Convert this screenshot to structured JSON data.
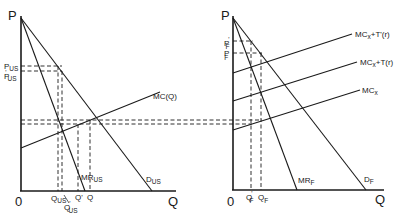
{
  "left_panel": {
    "name": "US market",
    "y_axis_label": "P",
    "x_axis_label": "Q",
    "origin_label": "0",
    "curves": {
      "demand": {
        "label": "D",
        "sub": "US"
      },
      "marginal_revenue": {
        "label": "MR",
        "sub": "US"
      },
      "marginal_cost": {
        "label": "MC(Q)"
      }
    },
    "price_labels": [
      {
        "label": "P",
        "sub": "US",
        "prime": ""
      },
      {
        "label": "P",
        "sub": "US",
        "prime": "'"
      }
    ],
    "quantity_labels": [
      {
        "label": "Q",
        "sub": "US",
        "prime": ""
      },
      {
        "label": "Q",
        "sub": "US",
        "prime": "'"
      },
      {
        "label": "Q'"
      },
      {
        "label": "Q"
      }
    ]
  },
  "right_panel": {
    "name": "Foreign market",
    "y_axis_label": "P",
    "x_axis_label": "Q",
    "origin_label": "0",
    "curves": {
      "demand": {
        "label": "D",
        "sub": "F"
      },
      "marginal_revenue": {
        "label": "MR",
        "sub": "F"
      },
      "mc_plus_t_prime": {
        "label": "MC",
        "sub": "x",
        "suffix": "+T'(r)"
      },
      "mc_plus_t": {
        "label": "MC",
        "sub": "x",
        "suffix": "+T(r)"
      },
      "mc": {
        "label": "MC",
        "sub": "x"
      }
    },
    "price_labels": [
      {
        "label": "P",
        "sub": "F",
        "prime": "'"
      },
      {
        "label": "P",
        "sub": "F",
        "prime": ""
      }
    ],
    "quantity_labels": [
      {
        "label": "Q",
        "sub": "F",
        "prime": "'"
      },
      {
        "label": "Q",
        "sub": "F",
        "prime": ""
      }
    ]
  }
}
